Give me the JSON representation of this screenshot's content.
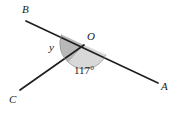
{
  "figure": {
    "type": "angle-diagram",
    "background_color": "#ffffff",
    "line_color": "#231f20",
    "shade_dark": "#b8b8b8",
    "shade_light": "#d8d8d8",
    "vertex": {
      "name": "O",
      "label": "O",
      "x": 84,
      "y": 45
    },
    "points": [
      {
        "name": "B",
        "label": "B",
        "x": 26,
        "y": 21,
        "label_x": 22,
        "label_y": 4
      },
      {
        "name": "A",
        "label": "A",
        "x": 158,
        "y": 83,
        "label_x": 161,
        "label_y": 81
      },
      {
        "name": "C",
        "label": "C",
        "x": 20,
        "y": 90,
        "label_x": 9,
        "label_y": 94
      }
    ],
    "segments": [
      {
        "name": "line-BA",
        "from": "B",
        "to": "A",
        "x1": 26,
        "y1": 21,
        "x2": 158,
        "y2": 83,
        "width": 1.6
      },
      {
        "name": "ray-OC",
        "from": "O",
        "to": "C",
        "x1": 84,
        "y1": 45,
        "x2": 20,
        "y2": 90,
        "width": 1.6
      }
    ],
    "angles": [
      {
        "name": "angle-y",
        "label": "y",
        "shade": "#b8b8b8",
        "between": [
          "OB",
          "OC"
        ],
        "label_x": 49,
        "label_y": 42,
        "radius": 26
      },
      {
        "name": "angle-117",
        "label": "117°",
        "value": 117,
        "unit": "degrees",
        "shade": "#d8d8d8",
        "between": [
          "OC",
          "OA"
        ],
        "label_x": 74,
        "label_y": 65,
        "radius": 22
      }
    ]
  }
}
